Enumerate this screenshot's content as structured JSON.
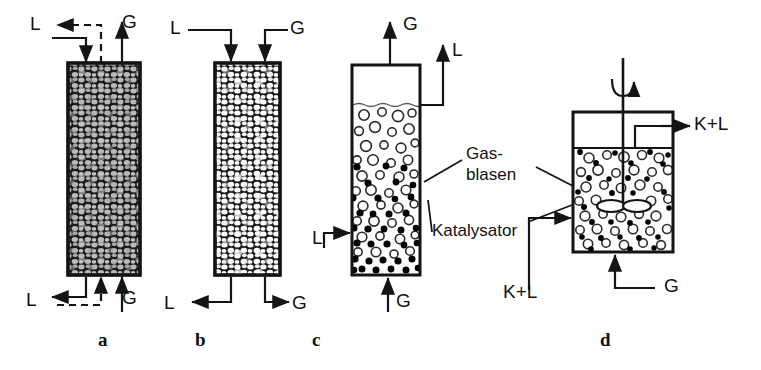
{
  "figure": {
    "caption_letters": [
      "a",
      "b",
      "c",
      "d"
    ],
    "stroke_color": "#141414",
    "packing_fill_a": "#b9b9b9",
    "packing_fill_b": "#ffffff",
    "packing_bg": "#1a1a1a",
    "bubble_color": "#ffffff",
    "catalyst_color": "#000000"
  },
  "panels": [
    {
      "id": "a",
      "letter": "a",
      "letter_x": 98,
      "letter_y": 330,
      "type": "trickle-bed-counter-current",
      "column": {
        "x": 68,
        "y": 63,
        "w": 72,
        "h": 212
      },
      "streams": [
        {
          "name": "liquid-out-top",
          "label": "L",
          "x": 30,
          "y": 14,
          "phase": "liquid",
          "line": "dashed"
        },
        {
          "name": "gas-out-top",
          "label": "G",
          "x": 122,
          "y": 12,
          "phase": "gas",
          "line": "solid"
        },
        {
          "name": "liquid-out-bottom",
          "label": "L",
          "x": 26,
          "y": 290,
          "phase": "liquid",
          "line": "solid"
        },
        {
          "name": "gas-in-bottom",
          "label": "G",
          "x": 122,
          "y": 288,
          "phase": "gas",
          "line": "solid"
        }
      ]
    },
    {
      "id": "b",
      "letter": "b",
      "letter_x": 195,
      "letter_y": 330,
      "type": "trickle-bed-co-current",
      "column": {
        "x": 215,
        "y": 63,
        "w": 65,
        "h": 212
      },
      "streams": [
        {
          "name": "liquid-in-top",
          "label": "L",
          "x": 170,
          "y": 18,
          "phase": "liquid",
          "line": "solid"
        },
        {
          "name": "gas-in-top",
          "label": "G",
          "x": 290,
          "y": 18,
          "phase": "gas",
          "line": "solid"
        },
        {
          "name": "liquid-out-bottom",
          "label": "L",
          "x": 164,
          "y": 293,
          "phase": "liquid",
          "line": "solid"
        },
        {
          "name": "gas-out-bottom",
          "label": "G",
          "x": 292,
          "y": 293,
          "phase": "gas",
          "line": "solid"
        }
      ]
    },
    {
      "id": "c",
      "letter": "c",
      "letter_x": 312,
      "letter_y": 330,
      "type": "slurry-bubble-column",
      "column": {
        "x": 352,
        "y": 65,
        "w": 68,
        "h": 210
      },
      "liquid_level_y": 105,
      "streams": [
        {
          "name": "gas-out-top",
          "label": "G",
          "x": 395,
          "y": 14,
          "phase": "gas",
          "line": "solid"
        },
        {
          "name": "liquid-out-top",
          "label": "L",
          "x": 446,
          "y": 40,
          "phase": "liquid",
          "line": "solid"
        },
        {
          "name": "liquid-in-side",
          "label": "L",
          "x": 320,
          "y": 228,
          "phase": "liquid",
          "line": "solid"
        },
        {
          "name": "gas-in-bottom",
          "label": "G",
          "x": 392,
          "y": 291,
          "phase": "gas",
          "line": "solid"
        }
      ]
    },
    {
      "id": "d",
      "letter": "d",
      "letter_x": 600,
      "letter_y": 330,
      "type": "stirred-tank-reactor",
      "vessel": {
        "x": 573,
        "y": 112,
        "w": 100,
        "h": 140
      },
      "liquid_level_y": 148,
      "streams": [
        {
          "name": "product-out",
          "label": "K+L",
          "x": 692,
          "y": 119,
          "phase": "catalyst-liquid",
          "line": "solid"
        },
        {
          "name": "feed-in",
          "label": "K+L",
          "x": 503,
          "y": 282,
          "phase": "catalyst-liquid",
          "line": "solid"
        },
        {
          "name": "gas-in-bottom",
          "label": "G",
          "x": 660,
          "y": 276,
          "phase": "gas",
          "line": "solid"
        }
      ],
      "stirrer": {
        "name": "impeller",
        "shaft_x": 623,
        "shaft_top": 58,
        "blade_y": 205
      }
    }
  ],
  "annotations": [
    {
      "name": "gas-bubbles-label",
      "lines": [
        "Gas-",
        "blasen"
      ],
      "x": 466,
      "y": 152
    },
    {
      "name": "catalyst-label",
      "lines": [
        "Katalysator"
      ],
      "x": 432,
      "y": 227
    }
  ]
}
